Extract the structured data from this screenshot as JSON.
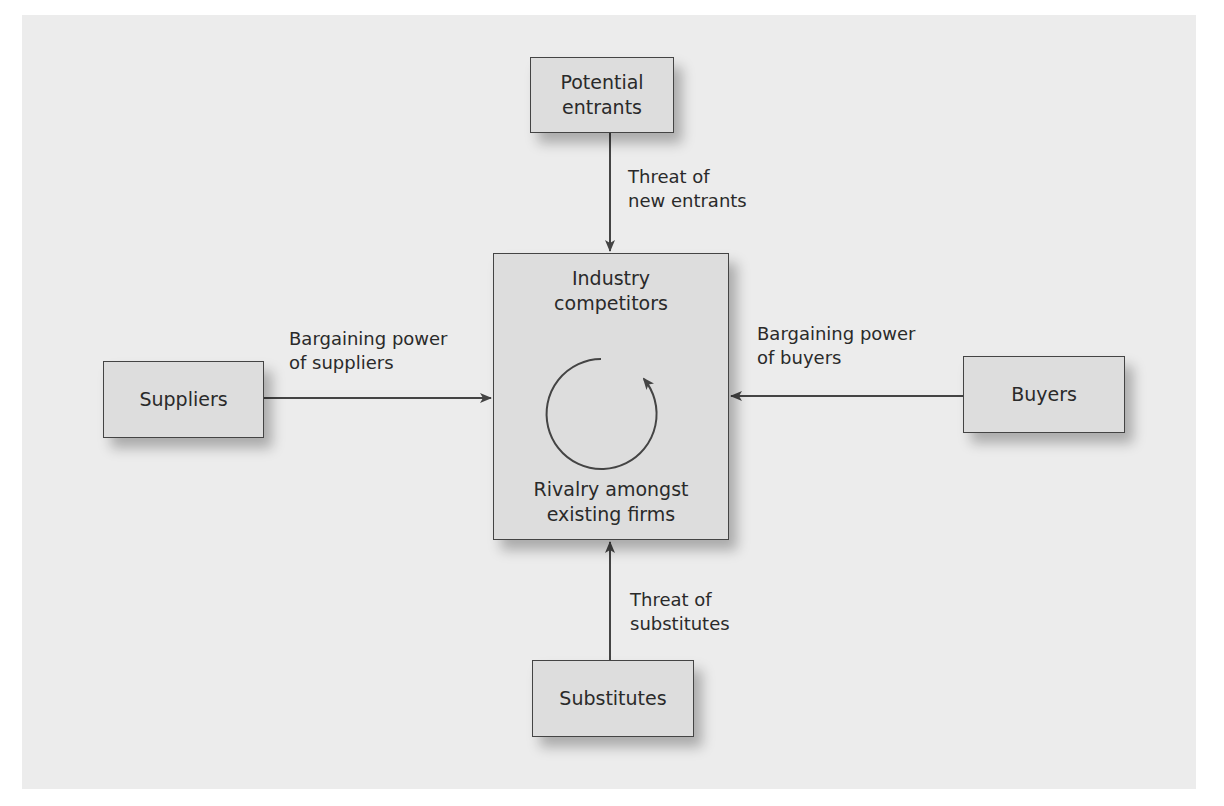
{
  "diagram": {
    "nodes": {
      "potential_entrants": "Potential\nentrants",
      "suppliers": "Suppliers",
      "buyers": "Buyers",
      "substitutes": "Substitutes",
      "industry_title": "Industry\ncompetitors",
      "rivalry": "Rivalry amongst\nexisting firms"
    },
    "edges": {
      "new_entrants": "Threat of\nnew entrants",
      "suppliers_power": "Bargaining power\nof suppliers",
      "buyers_power": "Bargaining power\nof buyers",
      "substitutes_threat": "Threat of\nsubstitutes"
    },
    "colors": {
      "background": "#ececec",
      "box_fill": "#dddddd",
      "line": "#444444"
    }
  }
}
